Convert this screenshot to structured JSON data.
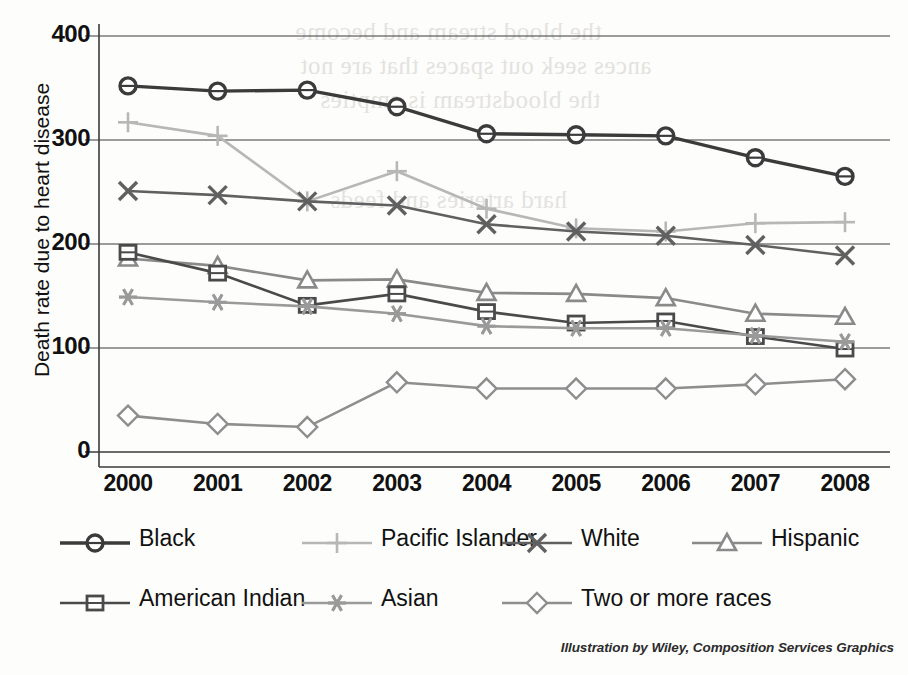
{
  "chart_data": {
    "type": "line",
    "title": "",
    "xlabel": "",
    "ylabel": "Death rate due to heart disease",
    "categories": [
      "2000",
      "2001",
      "2002",
      "2003",
      "2004",
      "2005",
      "2006",
      "2007",
      "2008"
    ],
    "x": [
      2000,
      2001,
      2002,
      2003,
      2004,
      2005,
      2006,
      2007,
      2008
    ],
    "ylim": [
      0,
      400
    ],
    "yticks": [
      0,
      100,
      200,
      300,
      400
    ],
    "xlim": [
      2000,
      2008
    ],
    "grid": "horizontal",
    "legend_position": "bottom",
    "series": [
      {
        "name": "Black",
        "marker": "circle",
        "color": "#3b3b3b",
        "values": [
          352,
          347,
          348,
          332,
          306,
          305,
          304,
          283,
          265
        ]
      },
      {
        "name": "Pacific Islander",
        "marker": "plus",
        "color": "#b7b7b7",
        "values": [
          317,
          304,
          241,
          270,
          234,
          215,
          212,
          220,
          221
        ]
      },
      {
        "name": "White",
        "marker": "x",
        "color": "#606060",
        "values": [
          251,
          247,
          241,
          237,
          219,
          212,
          208,
          199,
          189
        ]
      },
      {
        "name": "Hispanic",
        "marker": "triangle",
        "color": "#8a8a8a",
        "values": [
          186,
          179,
          165,
          166,
          153,
          152,
          148,
          133,
          130
        ]
      },
      {
        "name": "American Indian",
        "marker": "square",
        "color": "#4a4a4a",
        "values": [
          192,
          172,
          141,
          152,
          135,
          124,
          126,
          111,
          99
        ]
      },
      {
        "name": "Asian",
        "marker": "asterisk",
        "color": "#9a9a9a",
        "values": [
          149,
          144,
          140,
          133,
          121,
          119,
          119,
          112,
          106
        ]
      },
      {
        "name": "Two or more races",
        "marker": "diamond",
        "color": "#8e8e8e",
        "values": [
          35,
          27,
          24,
          67,
          61,
          61,
          61,
          65,
          70
        ]
      }
    ]
  },
  "axis": {
    "y_label": "Death rate due to heart disease",
    "y_ticks": [
      "400",
      "300",
      "200",
      "100",
      "0"
    ],
    "x_ticks": [
      "2000",
      "2001",
      "2002",
      "2003",
      "2004",
      "2005",
      "2006",
      "2007",
      "2008"
    ]
  },
  "legend": {
    "items": [
      {
        "label": "Black",
        "marker": "circle-marker",
        "color": "#3b3b3b"
      },
      {
        "label": "Pacific Islander",
        "marker": "plus-marker",
        "color": "#b7b7b7"
      },
      {
        "label": "White",
        "marker": "x-marker",
        "color": "#606060"
      },
      {
        "label": "Hispanic",
        "marker": "triangle-marker",
        "color": "#8a8a8a"
      },
      {
        "label": "American Indian",
        "marker": "square-marker",
        "color": "#4a4a4a"
      },
      {
        "label": "Asian",
        "marker": "asterisk-marker",
        "color": "#9a9a9a"
      },
      {
        "label": "Two or more races",
        "marker": "diamond-marker",
        "color": "#8e8e8e"
      }
    ]
  },
  "credit": "Illustration by Wiley, Composition Services Graphics",
  "bleed_text": [
    "the blood stream and become",
    "ances seek out spaces that are not",
    "the bloodstream is empties",
    "hard arteries and feeds"
  ]
}
